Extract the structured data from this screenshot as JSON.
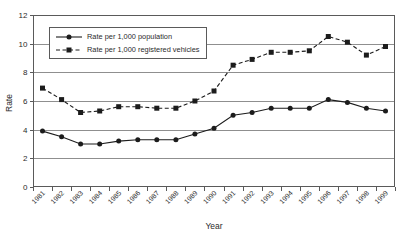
{
  "chart_data": {
    "type": "line",
    "title": "",
    "xlabel": "Year",
    "ylabel": "Rate",
    "x": [
      "1981",
      "1982",
      "1983",
      "1984",
      "1985",
      "1986",
      "1987",
      "1988",
      "1989",
      "1990",
      "1991",
      "1992",
      "1993",
      "1994",
      "1995",
      "1996",
      "1997",
      "1998",
      "1999"
    ],
    "ylim": [
      0,
      12
    ],
    "ytick_step": 2,
    "grid": "horizontal-gridlines",
    "legend_position": "top-left",
    "series": [
      {
        "key": "population",
        "name": "Rate per 1,000 population",
        "marker": "circle",
        "line_style": "solid",
        "values": [
          3.9,
          3.5,
          3.0,
          3.0,
          3.2,
          3.3,
          3.3,
          3.3,
          3.7,
          4.1,
          5.0,
          5.2,
          5.5,
          5.5,
          5.5,
          6.1,
          5.9,
          5.5,
          5.3
        ]
      },
      {
        "key": "registered-vehicles",
        "name": "Rate per 1,000 registered vehicles",
        "marker": "square",
        "line_style": "dashed",
        "values": [
          6.9,
          6.1,
          5.2,
          5.3,
          5.6,
          5.6,
          5.5,
          5.5,
          6.0,
          6.7,
          8.5,
          8.9,
          9.4,
          9.4,
          9.5,
          10.5,
          10.1,
          9.2,
          9.8
        ]
      }
    ],
    "colors": {
      "series": "#1c1c1c",
      "grid": "#8f8f8f",
      "axis": "#5a5a5a",
      "background": "#ffffff",
      "text": "#2b2b2b"
    }
  }
}
